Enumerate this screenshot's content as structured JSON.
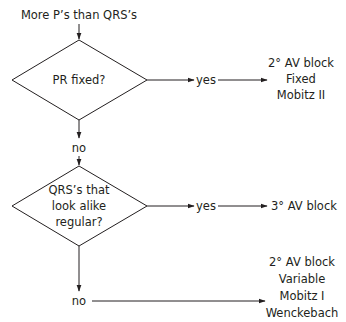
{
  "diagram": {
    "start": {
      "label": "More P’s than QRS’s"
    },
    "decision1": {
      "label": "PR fixed?",
      "yes_label": "yes",
      "yes_result": [
        "2° AV block",
        "Fixed",
        "Mobitz II"
      ],
      "no_label": "no"
    },
    "decision2": {
      "label_lines": [
        "QRS’s that",
        "look alike",
        "regular?"
      ],
      "yes_label": "yes",
      "yes_result": "3° AV block",
      "no_label": "no",
      "no_result": [
        "2° AV block",
        "Variable",
        "Mobitz I",
        "Wenckebach"
      ]
    },
    "colors": {
      "line": "#231f20",
      "background": "#ffffff"
    }
  }
}
